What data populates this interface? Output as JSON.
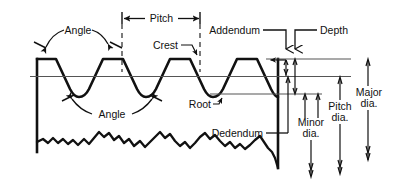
{
  "diagram": {
    "line_color": "#111111",
    "thin_line_color": "#555555",
    "background": "#ffffff",
    "labels": {
      "pitch": "Pitch",
      "angle_top": "Angle",
      "angle_bottom": "Angle",
      "crest": "Crest",
      "root": "Root",
      "addendum": "Addendum",
      "depth": "Depth",
      "dedendum": "Dedendum",
      "minor_dia_line1": "Minor",
      "minor_dia_line2": "dia.",
      "pitch_dia_line1": "Pitch",
      "pitch_dia_line2": "dia.",
      "major_dia_line1": "Major",
      "major_dia_line2": "dia."
    },
    "callouts": [
      {
        "name": "pitch",
        "text": "Pitch",
        "kind": "dimension-horizontal"
      },
      {
        "name": "angle-top",
        "text": "Angle",
        "kind": "angle-arrow-pair"
      },
      {
        "name": "angle-bottom",
        "text": "Angle",
        "kind": "angle-arrow-pair"
      },
      {
        "name": "crest",
        "text": "Crest",
        "kind": "leader"
      },
      {
        "name": "root",
        "text": "Root",
        "kind": "leader"
      },
      {
        "name": "addendum",
        "text": "Addendum",
        "kind": "leader-arrow-down"
      },
      {
        "name": "depth",
        "text": "Depth",
        "kind": "leader-arrow-down"
      },
      {
        "name": "dedendum",
        "text": "Dedendum",
        "kind": "leader"
      },
      {
        "name": "minor-dia",
        "text": "Minor dia.",
        "kind": "dimension-vertical"
      },
      {
        "name": "pitch-dia",
        "text": "Pitch dia.",
        "kind": "dimension-vertical"
      },
      {
        "name": "major-dia",
        "text": "Major dia.",
        "kind": "dimension-vertical"
      }
    ]
  }
}
